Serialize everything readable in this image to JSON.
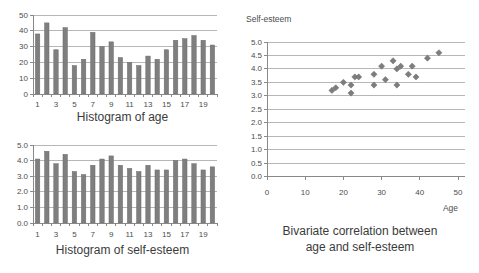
{
  "colors": {
    "background": "#ffffff",
    "bar_fill": "#7f7f7f",
    "marker_fill": "#7d7d7d",
    "gridline": "#b7b7b7",
    "axis_line": "#898989",
    "tick_text": "#4d4d4d",
    "title_text": "#3b3b3b"
  },
  "chart_data": [
    {
      "id": "age-histogram",
      "type": "bar",
      "title": "Histogram of age",
      "categories": [
        1,
        2,
        3,
        4,
        5,
        6,
        7,
        8,
        9,
        10,
        11,
        12,
        13,
        14,
        15,
        16,
        17,
        18,
        19,
        20
      ],
      "values": [
        38,
        45,
        28,
        42,
        18,
        22,
        39,
        30,
        33,
        23,
        20,
        18,
        24,
        22,
        28,
        34,
        35,
        37,
        34,
        31
      ],
      "xlabel": "",
      "ylabel": "",
      "ylim": [
        0,
        50
      ],
      "y_tick_labels": [
        "0",
        "10",
        "20",
        "30",
        "40",
        "50"
      ],
      "x_tick_labels": [
        "1",
        "3",
        "5",
        "7",
        "9",
        "11",
        "13",
        "15",
        "17",
        "19"
      ],
      "grid": "horizontal",
      "legend": "none"
    },
    {
      "id": "self-esteem-histogram",
      "type": "bar",
      "title": "Histogram of self-esteem",
      "categories": [
        1,
        2,
        3,
        4,
        5,
        6,
        7,
        8,
        9,
        10,
        11,
        12,
        13,
        14,
        15,
        16,
        17,
        18,
        19,
        20
      ],
      "values": [
        4.1,
        4.6,
        3.8,
        4.4,
        3.3,
        3.1,
        3.7,
        4.1,
        4.3,
        3.7,
        3.5,
        3.3,
        3.7,
        3.4,
        3.4,
        4.0,
        4.1,
        3.8,
        3.4,
        3.6
      ],
      "xlabel": "",
      "ylabel": "",
      "ylim": [
        0,
        5.0
      ],
      "y_tick_labels": [
        "0.0",
        "1.0",
        "2.0",
        "3.0",
        "4.0",
        "5.0"
      ],
      "x_tick_labels": [
        "1",
        "3",
        "5",
        "7",
        "9",
        "11",
        "13",
        "15",
        "17",
        "19"
      ],
      "grid": "horizontal",
      "legend": "none"
    },
    {
      "id": "age-selfesteem-scatter",
      "type": "scatter",
      "title": "Bivariate correlation between age and self-esteem",
      "title_line1": "Bivariate correlation between",
      "title_line2": "age and self-esteem",
      "xlabel": "Age",
      "ylabel": "Self-esteem",
      "xlim": [
        0,
        50
      ],
      "ylim": [
        0.0,
        5.0
      ],
      "x_tick_labels": [
        "0",
        "10",
        "20",
        "30",
        "40",
        "50"
      ],
      "y_tick_labels": [
        "0.0",
        "0.5",
        "1.0",
        "1.5",
        "2.0",
        "2.5",
        "3.0",
        "3.5",
        "4.0",
        "4.5",
        "5.0"
      ],
      "grid": "horizontal",
      "legend": "none",
      "points": [
        [
          17,
          3.2
        ],
        [
          18,
          3.3
        ],
        [
          20,
          3.5
        ],
        [
          22,
          3.1
        ],
        [
          22,
          3.4
        ],
        [
          23,
          3.7
        ],
        [
          24,
          3.7
        ],
        [
          28,
          3.4
        ],
        [
          28,
          3.8
        ],
        [
          30,
          4.1
        ],
        [
          31,
          3.6
        ],
        [
          33,
          4.3
        ],
        [
          34,
          3.4
        ],
        [
          34,
          4.0
        ],
        [
          35,
          4.1
        ],
        [
          37,
          3.8
        ],
        [
          38,
          4.1
        ],
        [
          39,
          3.7
        ],
        [
          42,
          4.4
        ],
        [
          45,
          4.6
        ]
      ]
    }
  ]
}
